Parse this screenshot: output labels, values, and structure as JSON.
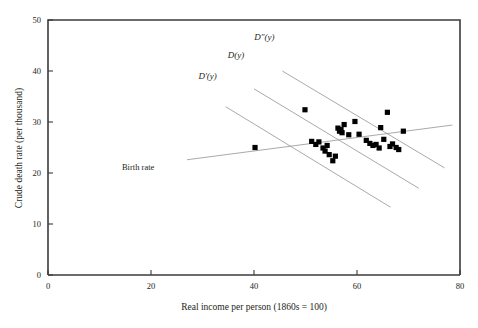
{
  "chart_data": {
    "type": "scatter",
    "title": "",
    "xlabel": "Real income per person (1860s = 100)",
    "ylabel": "Crude death rate (per thousand)",
    "xlim": [
      0,
      80
    ],
    "ylim": [
      0,
      50
    ],
    "xticks": [
      0,
      20,
      40,
      60,
      80
    ],
    "yticks": [
      0,
      10,
      20,
      30,
      40,
      50
    ],
    "grid": false,
    "legend_position": "inline-annotations",
    "points": [
      {
        "x": 40.2,
        "y": 25.0
      },
      {
        "x": 49.9,
        "y": 32.4
      },
      {
        "x": 51.2,
        "y": 26.2
      },
      {
        "x": 52.0,
        "y": 25.6
      },
      {
        "x": 52.6,
        "y": 26.1
      },
      {
        "x": 53.4,
        "y": 24.9
      },
      {
        "x": 53.8,
        "y": 24.3
      },
      {
        "x": 54.2,
        "y": 25.4
      },
      {
        "x": 54.6,
        "y": 23.6
      },
      {
        "x": 55.3,
        "y": 22.4
      },
      {
        "x": 55.8,
        "y": 23.3
      },
      {
        "x": 56.3,
        "y": 28.8
      },
      {
        "x": 56.6,
        "y": 28.2
      },
      {
        "x": 56.9,
        "y": 28.5
      },
      {
        "x": 57.1,
        "y": 27.9
      },
      {
        "x": 57.5,
        "y": 29.5
      },
      {
        "x": 58.4,
        "y": 27.5
      },
      {
        "x": 59.6,
        "y": 30.1
      },
      {
        "x": 60.4,
        "y": 27.6
      },
      {
        "x": 61.8,
        "y": 26.4
      },
      {
        "x": 62.5,
        "y": 25.8
      },
      {
        "x": 63.1,
        "y": 25.4
      },
      {
        "x": 63.7,
        "y": 25.6
      },
      {
        "x": 64.3,
        "y": 24.9
      },
      {
        "x": 64.6,
        "y": 28.9
      },
      {
        "x": 65.2,
        "y": 26.6
      },
      {
        "x": 65.9,
        "y": 31.9
      },
      {
        "x": 66.4,
        "y": 25.2
      },
      {
        "x": 66.9,
        "y": 25.7
      },
      {
        "x": 67.6,
        "y": 25.0
      },
      {
        "x": 68.1,
        "y": 24.6
      },
      {
        "x": 69.0,
        "y": 28.2
      }
    ],
    "lines": [
      {
        "name": "D''(y)",
        "label": "D″(y)",
        "label_x": 42.0,
        "label_y": 46.0,
        "x0": 45.5,
        "y0": 40.0,
        "x1": 77.0,
        "y1": 21.0
      },
      {
        "name": "D(y)",
        "label": "D(y)",
        "label_x": 36.5,
        "label_y": 42.5,
        "x0": 40.0,
        "y0": 36.5,
        "x1": 72.0,
        "y1": 17.0
      },
      {
        "name": "D'(y)",
        "label": "D′(y)",
        "label_x": 31.0,
        "label_y": 38.5,
        "x0": 34.5,
        "y0": 33.0,
        "x1": 66.5,
        "y1": 13.3
      },
      {
        "name": "Birth rate",
        "label": "Birth rate",
        "label_x": 17.5,
        "label_y": 20.5,
        "x0": 27.0,
        "y0": 22.6,
        "x1": 78.5,
        "y1": 29.4
      }
    ]
  }
}
